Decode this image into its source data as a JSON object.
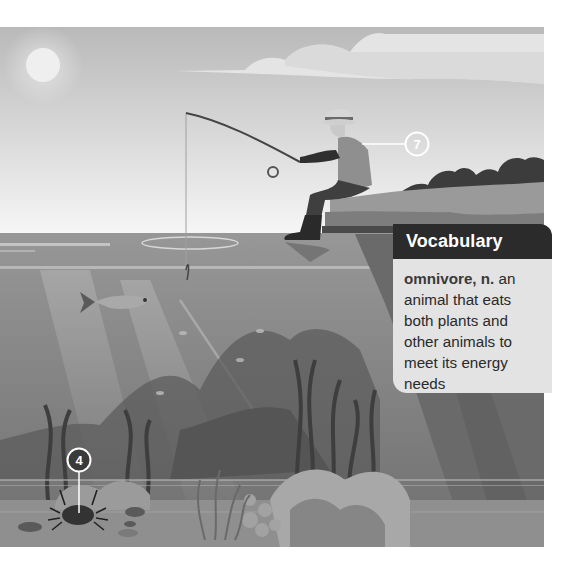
{
  "vocabulary": {
    "title": "Vocabulary",
    "term": "omnivore, n.",
    "definition": " an animal that eats both plants and other animals to meet its energy needs"
  },
  "markers": [
    {
      "id": "marker-7",
      "label": "7",
      "target": "fisherman"
    },
    {
      "id": "marker-4",
      "label": "4",
      "target": "crab"
    }
  ],
  "colors": {
    "sky_top": "#b9b9b9",
    "sky_bottom": "#f4f4f4",
    "water": "#8c8c8c",
    "vocab_header": "#2b2b2b",
    "vocab_body": "#e3e3e3"
  }
}
